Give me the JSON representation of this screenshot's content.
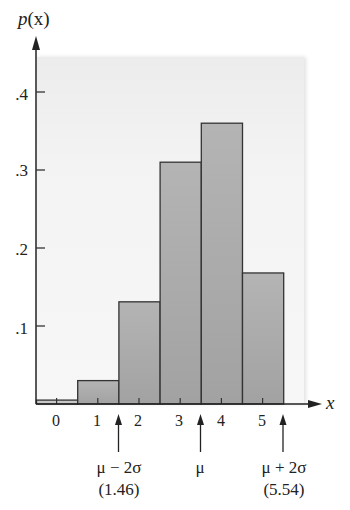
{
  "chart_data": {
    "type": "bar",
    "title": "",
    "xlabel": "x",
    "ylabel": "p(x)",
    "categories": [
      "0",
      "1",
      "2",
      "3",
      "4",
      "5"
    ],
    "values": [
      0.005,
      0.03,
      0.131,
      0.31,
      0.36,
      0.168
    ],
    "ylim": [
      0,
      0.45
    ],
    "yticks": [
      ".1",
      ".2",
      ".3",
      ".4"
    ],
    "grid": false,
    "legend": null,
    "annotations": [
      {
        "label": "μ − 2σ",
        "sublabel": "(1.46)",
        "x": 1.46
      },
      {
        "label": "μ",
        "sublabel": "",
        "x": 3.5
      },
      {
        "label": "μ + 2σ",
        "sublabel": "(5.54)",
        "x": 5.54
      }
    ],
    "bar_color": "#a9a9a9",
    "bar_edge_color": "#333333"
  },
  "axis": {
    "y_label_var": "p",
    "y_label_arg": "(x)",
    "x_label": "x"
  }
}
